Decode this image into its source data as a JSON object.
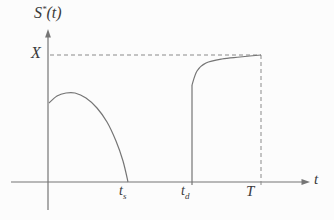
{
  "figure": {
    "background": "#fcfcfc",
    "line_color": "#757575",
    "dash_color": "#8a8a8a",
    "text_color": "#3a3a3a",
    "labels": {
      "y_axis": {
        "base": "S",
        "sup": "*",
        "args": "(t)"
      },
      "x_axis": "t",
      "y_level": "X",
      "tick_ts": {
        "base": "t",
        "sub": "s"
      },
      "tick_td": {
        "base": "t",
        "sub": "d"
      },
      "tick_T": "T"
    }
  },
  "chart_data": {
    "type": "line",
    "title": "",
    "xlabel": "t",
    "ylabel": "S*(t)",
    "x_tick_labels": [
      "t_s",
      "t_d",
      "T"
    ],
    "y_tick_labels": [
      "X"
    ],
    "grid": false,
    "legend": false,
    "axes_px": {
      "y_axis_x": 48,
      "y_axis_top": 30,
      "y_axis_bottom": 210,
      "x_axis_y": 182,
      "x_axis_left": 11,
      "x_axis_right": 309
    },
    "key_points_px": {
      "t_s_x": 128,
      "t_d_x": 192,
      "T_x": 261,
      "X_level_y": 55
    },
    "guides": [
      {
        "kind": "dashed-horizontal",
        "from": [
          50,
          55
        ],
        "to": [
          261,
          55
        ],
        "meaning": "inventory level X"
      },
      {
        "kind": "dashed-vertical",
        "from": [
          261,
          55
        ],
        "to": [
          261,
          187
        ],
        "meaning": "time T"
      }
    ],
    "series": [
      {
        "name": "cycle-1-inventory",
        "style": "smooth",
        "points_px": [
          [
            49,
            103
          ],
          [
            57,
            96
          ],
          [
            66,
            93
          ],
          [
            75,
            93
          ],
          [
            86,
            98
          ],
          [
            97,
            108
          ],
          [
            107,
            122
          ],
          [
            116,
            141
          ],
          [
            123,
            161
          ],
          [
            128,
            182
          ]
        ]
      },
      {
        "name": "cycle-2-jump",
        "style": "straight",
        "points_px": [
          [
            192,
            185
          ],
          [
            192,
            85
          ]
        ]
      },
      {
        "name": "cycle-2-inventory",
        "style": "smooth",
        "points_px": [
          [
            192,
            85
          ],
          [
            197,
            71
          ],
          [
            206,
            63
          ],
          [
            222,
            59
          ],
          [
            240,
            57
          ],
          [
            261,
            55
          ]
        ]
      }
    ]
  }
}
